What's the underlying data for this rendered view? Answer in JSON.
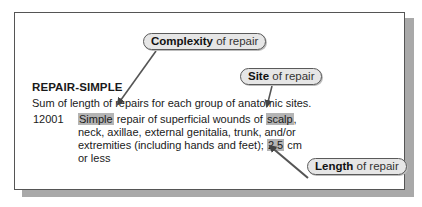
{
  "document": {
    "heading": "REPAIR-SIMPLE",
    "summary": "Sum of length of repairs for each group of anatomic sites.",
    "entry": {
      "code": "12001",
      "lines": [
        {
          "pre": "",
          "hl1": "Simple",
          "mid": " repair of superficial wounds of ",
          "hl2": "scalp",
          "post": ","
        },
        {
          "text": "neck, axillae, external genitalia, trunk, and/or"
        },
        {
          "pre": "extremities (including hands and feet); ",
          "hl": "2.5",
          "post": " cm"
        },
        {
          "text": "or less"
        }
      ]
    }
  },
  "callouts": [
    {
      "id": "complexity",
      "bold": "Complexity",
      "rest": " of repair",
      "target": "Simple"
    },
    {
      "id": "site",
      "bold": "Site",
      "rest": " of repair",
      "target": "scalp"
    },
    {
      "id": "length",
      "bold": "Length",
      "rest": " of repair",
      "target": "2.5"
    }
  ],
  "colors": {
    "highlight": "#b4b4b4",
    "pill_fill": "#e6e6e6",
    "pill_border": "#5a5a5a",
    "arrow": "#555555",
    "shadow": "#a9a9a9"
  }
}
